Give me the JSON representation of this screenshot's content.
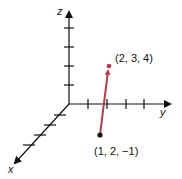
{
  "diagram": {
    "type": "3d-vector-plot",
    "axes": {
      "x": {
        "label": "x"
      },
      "y": {
        "label": "y"
      },
      "z": {
        "label": "z"
      }
    },
    "vector": {
      "start": {
        "label": "(1, 2, −1)",
        "coords": [
          1,
          2,
          -1
        ]
      },
      "end": {
        "label": "(2, 3, 4)",
        "coords": [
          2,
          3,
          4
        ]
      },
      "color": "#c0394b"
    },
    "axis_color": "#111111"
  }
}
